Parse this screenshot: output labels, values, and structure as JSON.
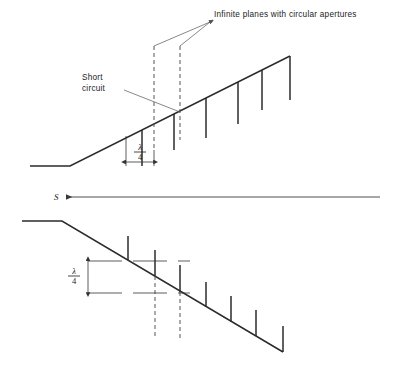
{
  "figure": {
    "background_color": "#ffffff",
    "line_color": "#2b2b2b",
    "dashed_color": "#555555",
    "width": 397,
    "height": 374
  },
  "annotations": {
    "apertures_label": "Infinite planes with circular apertures",
    "short_circuit_line1": "Short",
    "short_circuit_line2": "circuit",
    "s_label": "S",
    "lambda_symbol": "λ",
    "quarter_denominator": "4",
    "dimension_upper": "λ/4",
    "dimension_lower": "λ/4"
  },
  "upper_view": {
    "name": "upper-view",
    "guide_points": "30,166 70,166 290,56",
    "stub_count": 6,
    "stub_direction": "down",
    "stubs": [
      {
        "x": 142,
        "y_top": 130,
        "y_bottom": 166
      },
      {
        "x": 174,
        "y_top": 114,
        "y_bottom": 150
      },
      {
        "x": 206,
        "y_top": 98,
        "y_bottom": 138
      },
      {
        "x": 238,
        "y_top": 82,
        "y_bottom": 124
      },
      {
        "x": 262,
        "y_top": 70,
        "y_bottom": 110
      },
      {
        "x": 290,
        "y_top": 56,
        "y_bottom": 100
      }
    ],
    "dashed_planes": [
      {
        "x": 154,
        "y_top": 46,
        "y_bottom": 150
      },
      {
        "x": 180,
        "y_top": 46,
        "y_bottom": 140
      }
    ],
    "dimension": {
      "x_start": 126,
      "x_end": 154,
      "y_arrow": 162,
      "label": "λ/4"
    }
  },
  "lower_view": {
    "name": "lower-view",
    "guide_points": "22,221 62,221 283,352",
    "stub_count": 7,
    "stub_direction": "up",
    "stubs": [
      {
        "x": 128,
        "y_top": 236,
        "y_bottom": 260
      },
      {
        "x": 155,
        "y_top": 250,
        "y_bottom": 276
      },
      {
        "x": 180,
        "y_top": 265,
        "y_bottom": 292
      },
      {
        "x": 206,
        "y_top": 282,
        "y_bottom": 307
      },
      {
        "x": 231,
        "y_top": 296,
        "y_bottom": 322
      },
      {
        "x": 256,
        "y_top": 310,
        "y_bottom": 336
      },
      {
        "x": 283,
        "y_top": 326,
        "y_bottom": 352
      }
    ],
    "dashed_planes": [
      {
        "x": 155,
        "y_top": 276,
        "y_bottom": 338
      },
      {
        "x": 180,
        "y_top": 292,
        "y_bottom": 338
      }
    ],
    "dimension": {
      "y_start": 261,
      "y_end": 293,
      "x_arrow": 88,
      "label": "λ/4",
      "ref_line_top_x1": 88,
      "ref_line_top_x2": 190,
      "ref_line_bottom_x1": 88,
      "ref_line_bottom_x2": 190
    }
  },
  "center_axis": {
    "name": "s-axis",
    "x_start": 66,
    "x_end": 380,
    "y": 197
  }
}
